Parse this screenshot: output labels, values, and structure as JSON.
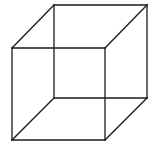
{
  "diagram": {
    "type": "wireframe-cube",
    "stroke_color": "#1a1a1a",
    "background": "#ffffff",
    "vertices": {
      "front_top_left": [
        12,
        48
      ],
      "front_top_right": [
        105,
        48
      ],
      "front_bottom_left": [
        12,
        140
      ],
      "front_bottom_right": [
        105,
        140
      ],
      "back_top_left": [
        54,
        5
      ],
      "back_top_right": [
        147,
        5
      ],
      "back_bottom_left": [
        54,
        98
      ],
      "back_bottom_right": [
        147,
        98
      ]
    },
    "edges": [
      [
        "front_top_left",
        "front_top_right"
      ],
      [
        "front_top_right",
        "front_bottom_right"
      ],
      [
        "front_bottom_right",
        "front_bottom_left"
      ],
      [
        "front_bottom_left",
        "front_top_left"
      ],
      [
        "back_top_left",
        "back_top_right"
      ],
      [
        "back_top_right",
        "back_bottom_right"
      ],
      [
        "back_bottom_right",
        "back_bottom_left"
      ],
      [
        "back_bottom_left",
        "back_top_left"
      ],
      [
        "front_top_left",
        "back_top_left"
      ],
      [
        "front_top_right",
        "back_top_right"
      ],
      [
        "front_bottom_left",
        "back_bottom_left"
      ],
      [
        "front_bottom_right",
        "back_bottom_right"
      ]
    ]
  }
}
